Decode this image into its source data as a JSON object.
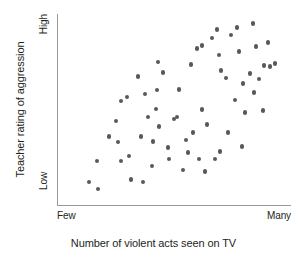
{
  "chart_data": {
    "type": "scatter",
    "title": "",
    "xlabel": "Number of violent acts seen on TV",
    "ylabel": "Teacher rating of aggression",
    "xlim": [
      0,
      100
    ],
    "ylim": [
      0,
      100
    ],
    "grid": false,
    "legend": null,
    "x_tick_labels": [
      "Few",
      "Many"
    ],
    "y_tick_labels": [
      "Low",
      "High"
    ],
    "point_color": "#58595b",
    "axis_color": "#9a9a9a",
    "background_color": "#ffffff",
    "series": [
      {
        "name": "students",
        "points": [
          [
            22.2,
            35.8
          ],
          [
            17.1,
            23.0
          ],
          [
            13.7,
            12.0
          ],
          [
            17.5,
            8.4
          ],
          [
            27.4,
            23.0
          ],
          [
            31.6,
            13.5
          ],
          [
            25.2,
            44.0
          ],
          [
            27.4,
            54.5
          ],
          [
            29.9,
            56.6
          ],
          [
            34.6,
            67.2
          ],
          [
            26.1,
            33.0
          ],
          [
            30.8,
            25.7
          ],
          [
            38.9,
            46.0
          ],
          [
            36.8,
            12.0
          ],
          [
            43.2,
            74.9
          ],
          [
            42.7,
            60.2
          ],
          [
            42.3,
            50.2
          ],
          [
            41.0,
            33.3
          ],
          [
            40.6,
            20.4
          ],
          [
            43.6,
            41.0
          ],
          [
            37.6,
            58.1
          ],
          [
            47.4,
            30.0
          ],
          [
            50.0,
            45.0
          ],
          [
            52.1,
            60.5
          ],
          [
            47.9,
            24.0
          ],
          [
            53.8,
            18.3
          ],
          [
            56.0,
            27.4
          ],
          [
            58.1,
            37.9
          ],
          [
            51.3,
            46.0
          ],
          [
            59.8,
            82.0
          ],
          [
            62.0,
            83.5
          ],
          [
            55.1,
            34.0
          ],
          [
            62.0,
            50.0
          ],
          [
            64.1,
            42.0
          ],
          [
            60.7,
            24.0
          ],
          [
            63.2,
            17.5
          ],
          [
            67.5,
            24.0
          ],
          [
            69.7,
            28.0
          ],
          [
            66.2,
            87.5
          ],
          [
            69.2,
            78.5
          ],
          [
            70.1,
            70.5
          ],
          [
            68.4,
            92.0
          ],
          [
            72.2,
            66.4
          ],
          [
            74.4,
            89.0
          ],
          [
            73.1,
            38.0
          ],
          [
            76.9,
            93.0
          ],
          [
            77.8,
            80.5
          ],
          [
            76.1,
            55.0
          ],
          [
            80.3,
            48.5
          ],
          [
            79.5,
            63.5
          ],
          [
            83.8,
            95.0
          ],
          [
            82.5,
            69.0
          ],
          [
            85.0,
            83.0
          ],
          [
            86.3,
            66.0
          ],
          [
            88.5,
            73.0
          ],
          [
            84.2,
            59.0
          ],
          [
            90.2,
            85.0
          ],
          [
            91.0,
            72.5
          ],
          [
            93.2,
            74.0
          ],
          [
            88.0,
            49.5
          ],
          [
            79.1,
            30.5
          ],
          [
            35.9,
            36.0
          ],
          [
            45.3,
            69.5
          ],
          [
            57.3,
            73.5
          ]
        ]
      }
    ]
  },
  "axis_labels": {
    "y_title": "Teacher rating of aggression",
    "y_high": "High",
    "y_low": "Low",
    "x_title": "Number of violent acts seen on TV",
    "x_few": "Few",
    "x_many": "Many"
  }
}
